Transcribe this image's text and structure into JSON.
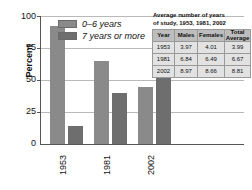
{
  "chart_data": {
    "type": "bar",
    "title": "",
    "xlabel": "",
    "ylabel": "Percent",
    "ylim": [
      0,
      100
    ],
    "yticks": [
      0,
      25,
      50,
      75,
      100
    ],
    "grid": true,
    "legend_position": "top-left inside plot",
    "categories": [
      "1953",
      "1981",
      "2002"
    ],
    "series": [
      {
        "name": "0–6 years",
        "color": "#8a8a8a",
        "values": [
          92,
          65,
          44
        ]
      },
      {
        "name": "7 years or more",
        "color": "#6e6e6e",
        "values": [
          14,
          40,
          61
        ]
      }
    ]
  },
  "yaxis": {
    "label": "Percent",
    "ticks": [
      "100",
      "75",
      "50",
      "25",
      "0"
    ]
  },
  "xaxis": {
    "labels": [
      "1953",
      "1981",
      "2002"
    ]
  },
  "legend": {
    "items": [
      {
        "label": "0–6 years"
      },
      {
        "label": "7 years or more"
      }
    ]
  },
  "table": {
    "title": "Average number of years of study, 1953, 1981, 2002",
    "title_line1": "Average number of years",
    "title_line2": "of study, 1953, 1981, 2002",
    "headers": [
      "Year",
      "Males",
      "Females",
      "Total Average"
    ],
    "header_total_line1": "Total",
    "header_total_line2": "Average",
    "rows": [
      {
        "year": "1953",
        "males": "3.97",
        "females": "4.01",
        "total": "3.99"
      },
      {
        "year": "1981",
        "males": "6.84",
        "females": "6.49",
        "total": "6.67"
      },
      {
        "year": "2002",
        "males": "8.97",
        "females": "8.66",
        "total": "8.81"
      }
    ]
  }
}
